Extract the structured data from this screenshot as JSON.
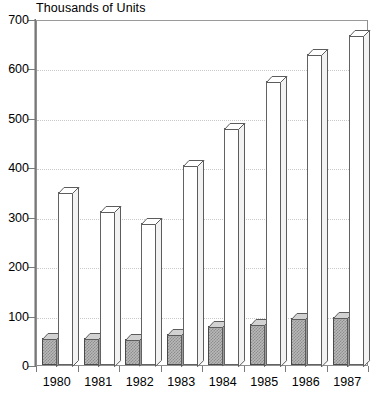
{
  "chart": {
    "title": "Thousands of Units",
    "xlabel": "",
    "ylabel": ""
  },
  "axis": {
    "y_ticks": [
      "0",
      "100",
      "200",
      "300",
      "400",
      "500",
      "600",
      "700"
    ],
    "x_ticks": [
      "1980",
      "1981",
      "1982",
      "1983",
      "1984",
      "1985",
      "1986",
      "1987"
    ]
  },
  "chart_data": {
    "type": "bar",
    "title": "Thousands of Units",
    "xlabel": "",
    "ylabel": "Thousands of Units",
    "ylim": [
      0,
      700
    ],
    "ytick_interval": 100,
    "grid": true,
    "legend": "none",
    "style": "3d-grouped-bar",
    "categories": [
      "1980",
      "1981",
      "1982",
      "1983",
      "1984",
      "1985",
      "1986",
      "1987"
    ],
    "series": [
      {
        "name": "Shaded series",
        "fill": "gray-hatched",
        "values": [
          55,
          55,
          52,
          63,
          78,
          83,
          95,
          98
        ]
      },
      {
        "name": "White series",
        "fill": "white",
        "values": [
          350,
          312,
          287,
          405,
          480,
          575,
          630,
          668
        ]
      }
    ]
  },
  "colors": {
    "background": "#ffffff",
    "frame": "#8e8e8e",
    "gridline": "#c9c9c9",
    "bar_white": "#ffffff",
    "bar_shaded": "#b9b9b9",
    "bar_outline": "#5c5c5c",
    "text": "#000000"
  }
}
